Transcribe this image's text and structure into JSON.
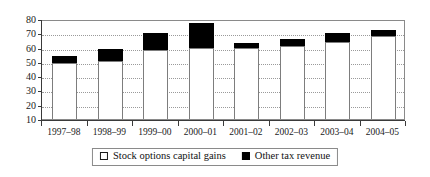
{
  "chart_data": {
    "type": "bar",
    "title": "",
    "subtitle": "",
    "xlabel": "",
    "ylabel": "",
    "stacked": true,
    "grid": true,
    "legend_position": "bottom-center",
    "ylim": [
      10,
      80
    ],
    "yticks": [
      10,
      20,
      30,
      40,
      50,
      60,
      70,
      80
    ],
    "ytick_labels": [
      "10",
      "20",
      "30",
      "40",
      "50",
      "60",
      "70",
      "80"
    ],
    "categories": [
      "1997–98",
      "1998–99",
      "1999–00",
      "2000–01",
      "2001–02",
      "2002–03",
      "2003–04",
      "2004–05"
    ],
    "series": [
      {
        "name": "Stock options capital gains",
        "color": "#ffffff",
        "values": [
          49,
          50.5,
          58,
          60,
          60,
          61,
          64,
          68
        ]
      },
      {
        "name": "Other tax revenue",
        "color": "#000000",
        "values": [
          5,
          8.5,
          12.5,
          17,
          3,
          5,
          6.5,
          4
        ]
      }
    ],
    "totals": [
      54,
      59,
      70.5,
      77,
      63,
      66,
      70.5,
      72
    ]
  },
  "legend": {
    "items": [
      {
        "label": "Stock options capital gains",
        "marker": "hollow-square"
      },
      {
        "label": "Other tax revenue",
        "marker": "filled-square"
      }
    ]
  }
}
